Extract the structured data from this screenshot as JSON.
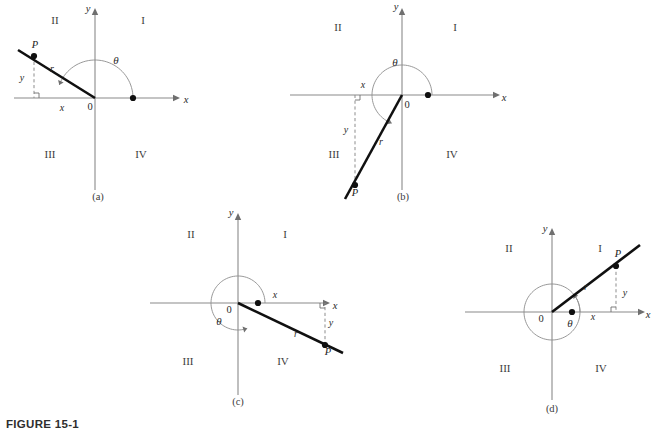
{
  "figure": {
    "caption": "FIGURE 15-1",
    "background_color": "#ffffff",
    "ray_color": "#101010",
    "axis_color": "#8a8a8a",
    "arc_color": "#8d8d8d"
  },
  "chart_data": {
    "type": "diagram",
    "title": "FIGURE 15-1",
    "common_labels": {
      "quadrants": [
        "I",
        "II",
        "III",
        "IV"
      ],
      "x_axis": "x",
      "y_axis": "y",
      "origin": "0",
      "point": "P",
      "radius": "r",
      "leg_x": "x",
      "leg_y": "y",
      "angle": "θ"
    },
    "panels": [
      {
        "id": "a",
        "panel_label": "(a)",
        "terminal_side_quadrant": "II",
        "angle_degrees": 160,
        "angle_type": "obtuse",
        "origin": [
          95,
          98
        ],
        "x_axis": [
          14,
          180
        ],
        "y_axis": [
          8,
          190
        ],
        "point_P": [
          34,
          56
        ],
        "ray_end": [
          18,
          50
        ],
        "foot": [
          34,
          98
        ],
        "arc_radius": 38,
        "arc_start_deg": 0,
        "arc_end_deg": 160,
        "axis_dot": [
          133,
          98
        ],
        "labels": {
          "quadrant_I": [
            143,
            24
          ],
          "quadrant_II": [
            55,
            24
          ],
          "quadrant_III": [
            50,
            158
          ],
          "quadrant_IV": [
            141,
            158
          ],
          "x_axis": [
            186,
            103
          ],
          "y_axis": [
            88,
            12
          ],
          "origin": [
            90,
            110
          ],
          "point_P": [
            35,
            48
          ],
          "radius": [
            52,
            72
          ],
          "leg_x": [
            62,
            111
          ],
          "leg_y": [
            22,
            81
          ],
          "angle": [
            116,
            64
          ],
          "panel": [
            98,
            200
          ]
        }
      },
      {
        "id": "b",
        "panel_label": "(b)",
        "terminal_side_quadrant": "III",
        "angle_degrees": 250,
        "angle_type": "reflex",
        "origin": [
          402,
          95
        ],
        "x_axis": [
          290,
          500
        ],
        "y_axis": [
          8,
          190
        ],
        "point_P": [
          355,
          185
        ],
        "ray_end": [
          345,
          199
        ],
        "foot": [
          355,
          95
        ],
        "arc_radius": 30,
        "arc_start_deg": 0,
        "arc_end_deg": 250,
        "axis_dot": [
          428,
          95
        ],
        "labels": {
          "quadrant_I": [
            455,
            31
          ],
          "quadrant_II": [
            338,
            31
          ],
          "quadrant_III": [
            334,
            158
          ],
          "quadrant_IV": [
            452,
            158
          ],
          "x_axis": [
            504,
            101
          ],
          "y_axis": [
            396,
            10
          ],
          "origin": [
            407,
            108
          ],
          "point_P": [
            355,
            196
          ],
          "radius": [
            381,
            145
          ],
          "leg_x": [
            363,
            88
          ],
          "leg_y": [
            346,
            133
          ],
          "angle": [
            395,
            66
          ],
          "panel": [
            403,
            200
          ]
        }
      },
      {
        "id": "c",
        "panel_label": "(c)",
        "terminal_side_quadrant": "IV",
        "angle_degrees": 290,
        "angle_type": "reflex",
        "origin": [
          238,
          303
        ],
        "x_axis": [
          150,
          330
        ],
        "y_axis": [
          213,
          395
        ],
        "point_P": [
          325,
          345
        ],
        "ray_end": [
          343,
          353
        ],
        "foot": [
          325,
          303
        ],
        "arc_radius": 27,
        "arc_start_deg": 0,
        "arc_end_deg": 290,
        "axis_dot": [
          258,
          303
        ],
        "labels": {
          "quadrant_I": [
            285,
            238
          ],
          "quadrant_II": [
            191,
            238
          ],
          "quadrant_III": [
            188,
            365
          ],
          "quadrant_IV": [
            283,
            365
          ],
          "x_axis": [
            335,
            309
          ],
          "y_axis": [
            231,
            216
          ],
          "origin": [
            229,
            313
          ],
          "point_P": [
            328,
            355
          ],
          "radius": [
            296,
            337
          ],
          "leg_x": [
            275,
            298
          ],
          "leg_y": [
            331,
            326
          ],
          "angle": [
            219,
            325
          ],
          "panel": [
            238,
            405
          ]
        }
      },
      {
        "id": "d",
        "panel_label": "(d)",
        "terminal_side_quadrant": "I",
        "angle_degrees": 400,
        "angle_type": "greater-than-revolution",
        "origin": [
          552,
          312
        ],
        "x_axis": [
          465,
          645
        ],
        "y_axis": [
          228,
          400
        ],
        "point_P": [
          616,
          266
        ],
        "ray_end": [
          640,
          245
        ],
        "foot": [
          616,
          312
        ],
        "arc_radius": 28,
        "arc_start_deg": 0,
        "arc_end_deg": 400,
        "axis_dot": [
          572,
          312
        ],
        "labels": {
          "quadrant_I": [
            600,
            252
          ],
          "quadrant_II": [
            509,
            252
          ],
          "quadrant_III": [
            505,
            372
          ],
          "quadrant_IV": [
            601,
            372
          ],
          "x_axis": [
            648,
            318
          ],
          "y_axis": [
            545,
            232
          ],
          "origin": [
            541,
            322
          ],
          "point_P": [
            618,
            257
          ],
          "radius": [
            586,
            290
          ],
          "leg_x": [
            593,
            320
          ],
          "leg_y": [
            625,
            296
          ],
          "angle": [
            570,
            327
          ],
          "panel": [
            552,
            412
          ]
        }
      }
    ]
  }
}
